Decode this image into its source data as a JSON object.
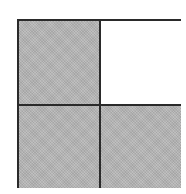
{
  "diagram": {
    "type": "fraction-grid",
    "rows": 2,
    "columns": 2,
    "cells": [
      {
        "position": "top-left",
        "shaded": true
      },
      {
        "position": "top-right",
        "shaded": false
      },
      {
        "position": "bottom-left",
        "shaded": true
      },
      {
        "position": "bottom-right",
        "shaded": true
      }
    ],
    "shaded_count": 3,
    "total_count": 4,
    "colors": {
      "shaded": "#b9b9b9",
      "empty": "#ffffff",
      "border": "#2a2a2a"
    }
  }
}
